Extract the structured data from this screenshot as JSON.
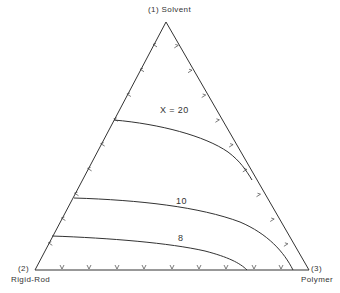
{
  "diagram": {
    "type": "ternary-phase-diagram",
    "vertices": {
      "top": {
        "number": "(1)",
        "name": "Solvent"
      },
      "bottom_left": {
        "number": "(2)",
        "name": "Rigid-Rod"
      },
      "bottom_right": {
        "number": "(3)",
        "name": "Polymer"
      }
    },
    "curves": [
      {
        "label": "X = 20"
      },
      {
        "label": "10"
      },
      {
        "label": "8"
      }
    ],
    "ticks_per_edge": 9,
    "line_color": "#333333",
    "background_color": "#ffffff"
  }
}
